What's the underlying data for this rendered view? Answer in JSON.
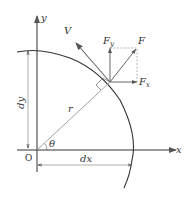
{
  "diagram": {
    "axes": {
      "x_label": "x",
      "y_label": "y",
      "origin_label": "O"
    },
    "angle_label": "θ",
    "radius_label": "r",
    "dimensions": {
      "dx_label": "dx",
      "dy_label": "dy"
    },
    "vectors": {
      "velocity_label": "V",
      "force_label": "F",
      "force_x_label": "F",
      "force_x_sub": "x",
      "force_y_label": "F",
      "force_y_sub": "y"
    },
    "colors": {
      "line": "#333333",
      "light_line": "#999999",
      "vector": "#666666"
    }
  }
}
